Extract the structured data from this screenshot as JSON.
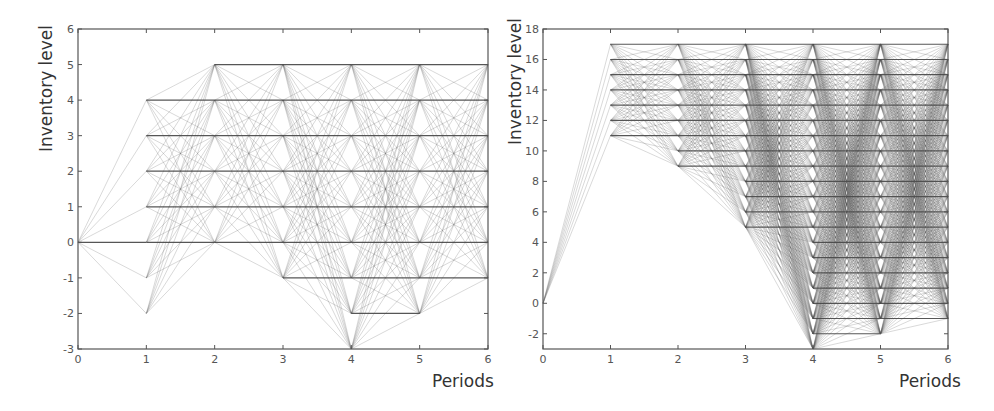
{
  "chart_data": [
    {
      "type": "line",
      "title": "",
      "xlabel": "Periods",
      "ylabel": "Inventory level",
      "x_ticks": [
        0,
        1,
        2,
        3,
        4,
        5,
        6
      ],
      "y_ticks": [
        -3,
        -2,
        -1,
        0,
        1,
        2,
        3,
        4,
        5,
        6
      ],
      "xlim": [
        0,
        6
      ],
      "ylim": [
        -3,
        6
      ],
      "grid": false,
      "description": "Network of inventory-level transitions between periods",
      "nodes_per_period": {
        "0": [
          0
        ],
        "1": [
          -2,
          -1,
          0,
          1,
          2,
          3,
          4
        ],
        "2": [
          0,
          1,
          2,
          3,
          4,
          5
        ],
        "3": [
          -1,
          0,
          1,
          2,
          3,
          4,
          5
        ],
        "4": [
          -3,
          -2,
          -1,
          0,
          1,
          2,
          3,
          4,
          5
        ],
        "5": [
          -2,
          -1,
          0,
          1,
          2,
          3,
          4,
          5
        ],
        "6": [
          -1,
          0,
          1,
          2,
          3,
          4,
          5
        ]
      }
    },
    {
      "type": "line",
      "title": "",
      "xlabel": "Periods",
      "ylabel": "Inventory level",
      "x_ticks": [
        0,
        1,
        2,
        3,
        4,
        5,
        6
      ],
      "y_ticks": [
        -2,
        0,
        2,
        4,
        6,
        8,
        10,
        12,
        14,
        16,
        18
      ],
      "xlim": [
        0,
        6
      ],
      "ylim": [
        -3,
        18
      ],
      "grid": false,
      "description": "Network of inventory-level transitions between periods",
      "nodes_per_period": {
        "0": [
          0
        ],
        "1": [
          11,
          12,
          13,
          14,
          15,
          16,
          17
        ],
        "2": [
          9,
          10,
          11,
          12,
          13,
          14,
          15,
          16,
          17
        ],
        "3": [
          5,
          6,
          7,
          8,
          9,
          10,
          11,
          12,
          13,
          14,
          15,
          16,
          17
        ],
        "4": [
          -3,
          -2,
          -1,
          0,
          1,
          2,
          3,
          4,
          5,
          6,
          7,
          8,
          9,
          10,
          11,
          12,
          13,
          14,
          15,
          16,
          17
        ],
        "5": [
          -2,
          -1,
          0,
          1,
          2,
          3,
          4,
          5,
          6,
          7,
          8,
          9,
          10,
          11,
          12,
          13,
          14,
          15,
          16,
          17
        ],
        "6": [
          -1,
          0,
          1,
          2,
          3,
          4,
          5,
          6,
          7,
          8,
          9,
          10,
          11,
          12,
          13,
          14,
          15,
          16,
          17
        ]
      }
    }
  ],
  "panels": [
    {
      "ylabel": "Inventory level",
      "xlabel": "Periods",
      "plot": {
        "x0": 78,
        "x1": 488,
        "y_top": 29,
        "y_bottom": 349
      }
    },
    {
      "ylabel": "Inventory level",
      "xlabel": "Periods",
      "plot": {
        "x0": 543,
        "x1": 948,
        "y_top": 29,
        "y_bottom": 349
      }
    }
  ],
  "colors": {
    "axis": "#555555",
    "edge": "#555555",
    "horizontal": "#444444",
    "text": "#333333"
  }
}
